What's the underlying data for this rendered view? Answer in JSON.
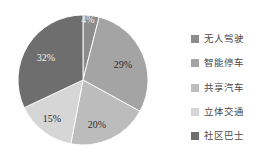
{
  "chart_data": {
    "type": "pie",
    "title": "",
    "categories": [
      "无人驾驶",
      "智能停车",
      "共享汽车",
      "立体交通",
      "社区巴士"
    ],
    "values": [
      4,
      29,
      20,
      15,
      32
    ],
    "labels": [
      "4%",
      "29%",
      "20%",
      "15%",
      "32%"
    ],
    "colors": [
      "#8c8c8c",
      "#a4a4a4",
      "#bcbcbc",
      "#d6d6d6",
      "#6e6e6e"
    ],
    "start_angle": "top, clockwise",
    "legend_position": "right",
    "grid": false
  }
}
